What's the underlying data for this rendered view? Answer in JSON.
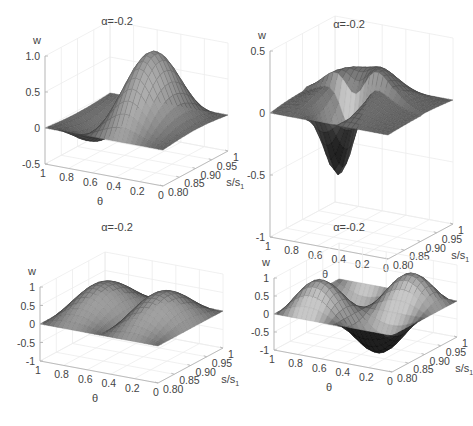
{
  "chart_data": [
    {
      "type": "surface",
      "title": "α=-0.2",
      "xlabel": "θ",
      "ylabel": "s/s",
      "ylabel_sub": "1",
      "zlabel": "w",
      "xlim": [
        0,
        1
      ],
      "ylim": [
        0.8,
        1
      ],
      "zlim": [
        -0.5,
        1.0
      ],
      "xticks": [
        "1",
        "0.8",
        "0.6",
        "0.4",
        "0.2",
        "0"
      ],
      "xtick_values": [
        1,
        0.8,
        0.6,
        0.4,
        0.2,
        0
      ],
      "yticks": [
        "0.80",
        "0.85",
        "0.90",
        "0.95",
        "1"
      ],
      "ytick_values": [
        0.8,
        0.85,
        0.9,
        0.95,
        1
      ],
      "zticks": [
        "-0.5",
        "0",
        "0.5",
        "1.0"
      ],
      "ztick_values": [
        -0.5,
        0,
        0.5,
        1.0
      ],
      "mode": "single-peak-with-trough",
      "description": "Surface rising to peak w≈1.0 near θ≈0.6 at s/s1≈0.9, with trough ≈-0.3 near θ≈0.2"
    },
    {
      "type": "surface",
      "title": "α=-0.2",
      "xlabel": "θ",
      "ylabel": "s/s",
      "ylabel_sub": "1",
      "zlabel": "w",
      "xlim": [
        0,
        1
      ],
      "ylim": [
        0.8,
        1
      ],
      "zlim": [
        -1,
        0.5
      ],
      "xticks": [
        "1",
        "0.8",
        "0.6",
        "0.4",
        "0.2",
        "0"
      ],
      "xtick_values": [
        1,
        0.8,
        0.6,
        0.4,
        0.2,
        0
      ],
      "yticks": [
        "0.80",
        "0.85",
        "0.90",
        "0.95",
        "1"
      ],
      "ytick_values": [
        0.8,
        0.85,
        0.9,
        0.95,
        1
      ],
      "zticks": [
        "-1",
        "-0.5",
        "0",
        "0.5"
      ],
      "ztick_values": [
        -1,
        -0.5,
        0,
        0.5
      ],
      "mode": "ridge-and-dip",
      "description": "Flat-ish surface with a raised ridge ≈0.4 and a deep dip ≈-0.8 near θ≈0.4"
    },
    {
      "type": "surface",
      "title": "α=-0.2",
      "xlabel": "θ",
      "ylabel": "s/s",
      "ylabel_sub": "1",
      "zlabel": "w",
      "xlim": [
        0,
        1
      ],
      "ylim": [
        0.8,
        1
      ],
      "zlim": [
        -1,
        1
      ],
      "xticks": [
        "1",
        "0.8",
        "0.6",
        "0.4",
        "0.2",
        "0"
      ],
      "xtick_values": [
        1,
        0.8,
        0.6,
        0.4,
        0.2,
        0
      ],
      "yticks": [
        "0.80",
        "0.85",
        "0.90",
        "0.95",
        "1"
      ],
      "ytick_values": [
        0.8,
        0.85,
        0.9,
        0.95,
        1
      ],
      "zticks": [
        "-1",
        "-0.5",
        "0",
        "0.5",
        "1"
      ],
      "ztick_values": [
        -1,
        -0.5,
        0,
        0.5,
        1
      ],
      "mode": "double-hump",
      "description": "Two humps along θ with peaks ≈0.8, zero at edges"
    },
    {
      "type": "surface",
      "title": "α=-0.2",
      "xlabel": "θ",
      "ylabel": "s/s",
      "ylabel_sub": "1",
      "zlabel": "w",
      "xlim": [
        0,
        1
      ],
      "ylim": [
        0.8,
        1
      ],
      "zlim": [
        -1,
        1
      ],
      "xticks": [
        "1",
        "0.8",
        "0.6",
        "0.4",
        "0.2",
        "0"
      ],
      "xtick_values": [
        1,
        0.8,
        0.6,
        0.4,
        0.2,
        0
      ],
      "yticks": [
        "0.80",
        "0.85",
        "0.90",
        "0.95",
        "1"
      ],
      "ytick_values": [
        0.8,
        0.85,
        0.9,
        0.95,
        1
      ],
      "zticks": [
        "-1",
        "-0.5",
        "0",
        "0.5",
        "1"
      ],
      "ztick_values": [
        -1,
        -0.5,
        0,
        0.5,
        1
      ],
      "mode": "saddle",
      "description": "Antisymmetric saddle-like mode with peaks ≈0.8 and troughs ≈-0.8"
    }
  ]
}
